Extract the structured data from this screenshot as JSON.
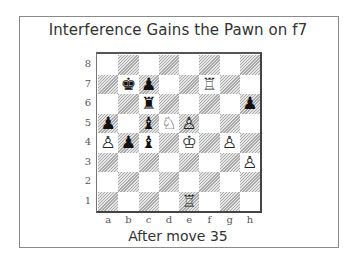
{
  "title": "Interference Gains the Pawn on f7",
  "caption": "After move 35",
  "board": {
    "orientation": "white",
    "files": [
      "a",
      "b",
      "c",
      "d",
      "e",
      "f",
      "g",
      "h"
    ],
    "ranks": [
      "8",
      "7",
      "6",
      "5",
      "4",
      "3",
      "2",
      "1"
    ],
    "light_square_color": "#ffffff",
    "dark_square_style": "hatched",
    "pieces": {
      "b7": {
        "color": "black",
        "type": "king",
        "glyph": "♚"
      },
      "c7": {
        "color": "black",
        "type": "pawn",
        "glyph": "♟"
      },
      "f7": {
        "color": "white",
        "type": "rook",
        "glyph": "♖"
      },
      "c6": {
        "color": "black",
        "type": "rook",
        "glyph": "♜"
      },
      "h6": {
        "color": "black",
        "type": "pawn",
        "glyph": "♟"
      },
      "a5": {
        "color": "black",
        "type": "pawn",
        "glyph": "♟"
      },
      "c5": {
        "color": "black",
        "type": "bishop",
        "glyph": "♝"
      },
      "d5": {
        "color": "white",
        "type": "knight",
        "glyph": "♘"
      },
      "e5": {
        "color": "white",
        "type": "pawn",
        "glyph": "♙"
      },
      "a4": {
        "color": "white",
        "type": "pawn",
        "glyph": "♙"
      },
      "b4": {
        "color": "black",
        "type": "pawn",
        "glyph": "♟"
      },
      "c4": {
        "color": "black",
        "type": "bishop",
        "glyph": "♝"
      },
      "e4": {
        "color": "white",
        "type": "king",
        "glyph": "♔"
      },
      "g4": {
        "color": "white",
        "type": "pawn",
        "glyph": "♙"
      },
      "h3": {
        "color": "white",
        "type": "pawn",
        "glyph": "♙"
      },
      "e1": {
        "color": "white",
        "type": "rook",
        "glyph": "♖"
      }
    }
  }
}
